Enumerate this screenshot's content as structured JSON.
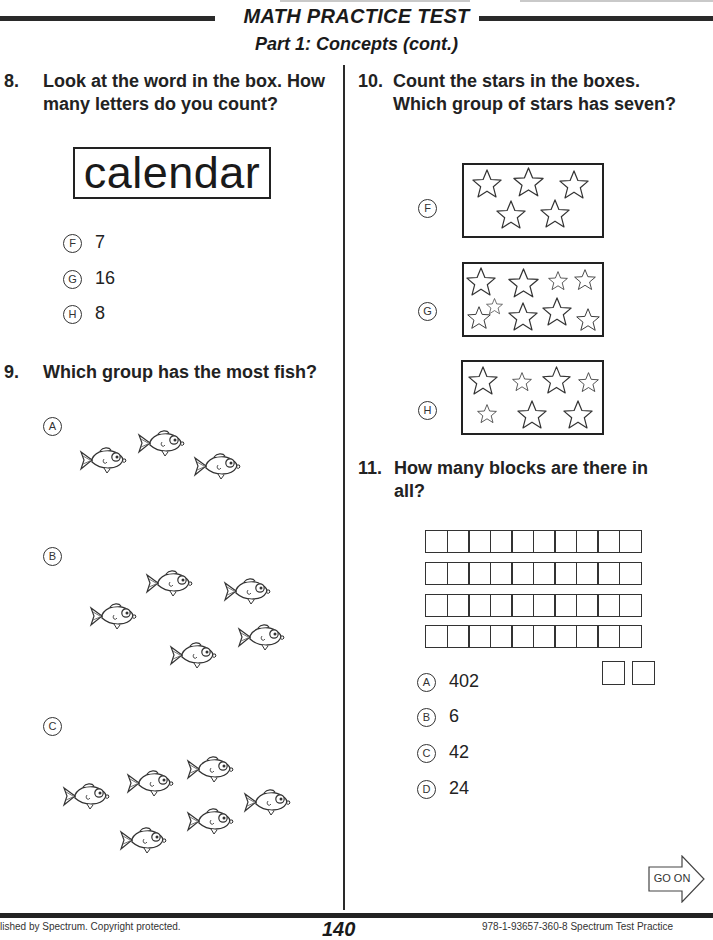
{
  "header": {
    "title": "MATH PRACTICE TEST",
    "subtitle": "Part 1: Concepts  (cont.)"
  },
  "questions": {
    "q8": {
      "number": "8.",
      "text_line1": "Look at the word in the box. How",
      "text_line2": "many letters do you count?",
      "boxed_word": "calendar",
      "options": [
        {
          "letter": "F",
          "value": "7"
        },
        {
          "letter": "G",
          "value": "16"
        },
        {
          "letter": "H",
          "value": "8"
        }
      ]
    },
    "q9": {
      "number": "9.",
      "text": "Which group has the most fish?",
      "options": [
        {
          "letter": "A",
          "fish_count": 3
        },
        {
          "letter": "B",
          "fish_count": 5
        },
        {
          "letter": "C",
          "fish_count": 7
        }
      ]
    },
    "q10": {
      "number": "10.",
      "text_line1": "Count the stars in the boxes.",
      "text_line2": "Which group of stars has seven?",
      "options": [
        {
          "letter": "F",
          "star_count": 5
        },
        {
          "letter": "G",
          "star_count": 10
        },
        {
          "letter": "H",
          "star_count": 7
        }
      ]
    },
    "q11": {
      "number": "11.",
      "text_line1": "How many blocks are there in",
      "text_line2": "all?",
      "blocks": {
        "rows_of_ten": 4,
        "singles": 2
      },
      "options": [
        {
          "letter": "A",
          "value": "402"
        },
        {
          "letter": "B",
          "value": "6"
        },
        {
          "letter": "C",
          "value": "42"
        },
        {
          "letter": "D",
          "value": "24"
        }
      ]
    }
  },
  "footer": {
    "go_on": "GO ON",
    "left_text": "lished by Spectrum. Copyright protected.",
    "page_number": "140",
    "right_text": "978-1-93657-360-8 Spectrum Test Practice"
  }
}
